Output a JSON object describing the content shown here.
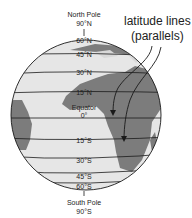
{
  "diagram": {
    "north_pole": {
      "name": "North Pole",
      "degree": "90°N"
    },
    "south_pole": {
      "name": "South Pole",
      "degree": "90°S"
    },
    "callout": {
      "line1": "latitude lines",
      "line2": "(parallels)"
    },
    "equator": {
      "name": "Equator",
      "degree": "0°"
    },
    "latitudes": [
      {
        "label": "60°N",
        "y": 38
      },
      {
        "label": "45°N",
        "y": 52
      },
      {
        "label": "30°N",
        "y": 71
      },
      {
        "label": "15°N",
        "y": 91
      },
      {
        "label": "15°S",
        "y": 141
      },
      {
        "label": "30°S",
        "y": 161
      },
      {
        "label": "45°S",
        "y": 177
      },
      {
        "label": "60°S",
        "y": 187
      }
    ],
    "colors": {
      "ocean": "#e6e6e6",
      "land": "#7c7c7c",
      "lines": "#1a1a1a",
      "text": "#222222"
    }
  }
}
